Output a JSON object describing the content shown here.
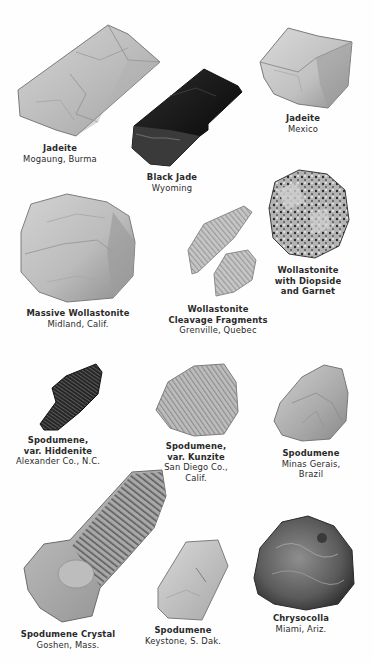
{
  "plate": {
    "specimens": [
      {
        "id": "jadeite-burma",
        "name_lines": [
          "Jadeite"
        ],
        "location_lines": [
          "Mogaung, Burma"
        ],
        "tone": "light"
      },
      {
        "id": "black-jade",
        "name_lines": [
          "Black Jade"
        ],
        "location_lines": [
          "Wyoming"
        ],
        "tone": "black"
      },
      {
        "id": "jadeite-mexico",
        "name_lines": [
          "Jadeite"
        ],
        "location_lines": [
          "Mexico"
        ],
        "tone": "light"
      },
      {
        "id": "massive-wollastonite",
        "name_lines": [
          "Massive Wollastonite"
        ],
        "location_lines": [
          "Midland, Calif."
        ],
        "tone": "light"
      },
      {
        "id": "wollastonite-cleavage",
        "name_lines": [
          "Wollastonite",
          "Cleavage Fragments"
        ],
        "location_lines": [
          "Grenville, Quebec"
        ],
        "tone": "light-fibrous"
      },
      {
        "id": "wollastonite-diopside-garnet",
        "name_lines": [
          "Wollastonite",
          "with Diopside",
          "and Garnet"
        ],
        "location_lines": [],
        "tone": "speckled"
      },
      {
        "id": "spodumene-hiddenite",
        "name_lines": [
          "Spodumene,",
          "var. Hiddenite"
        ],
        "location_lines": [
          "Alexander Co., N.C."
        ],
        "tone": "dark"
      },
      {
        "id": "spodumene-kunzite",
        "name_lines": [
          "Spodumene,",
          "var. Kunzite"
        ],
        "location_lines": [
          "San Diego Co.,",
          "Calif."
        ],
        "tone": "medium-fibrous"
      },
      {
        "id": "spodumene-brazil",
        "name_lines": [
          "Spodumene"
        ],
        "location_lines": [
          "Minas Gerais,",
          "Brazil"
        ],
        "tone": "medium"
      },
      {
        "id": "spodumene-crystal",
        "name_lines": [
          "Spodumene Crystal"
        ],
        "location_lines": [
          "Goshen, Mass."
        ],
        "tone": "striated"
      },
      {
        "id": "spodumene-dakota",
        "name_lines": [
          "Spodumene"
        ],
        "location_lines": [
          "Keystone, S. Dak."
        ],
        "tone": "light"
      },
      {
        "id": "chrysocolla",
        "name_lines": [
          "Chrysocolla"
        ],
        "location_lines": [
          "Miami, Ariz."
        ],
        "tone": "dark-mottled"
      }
    ]
  }
}
